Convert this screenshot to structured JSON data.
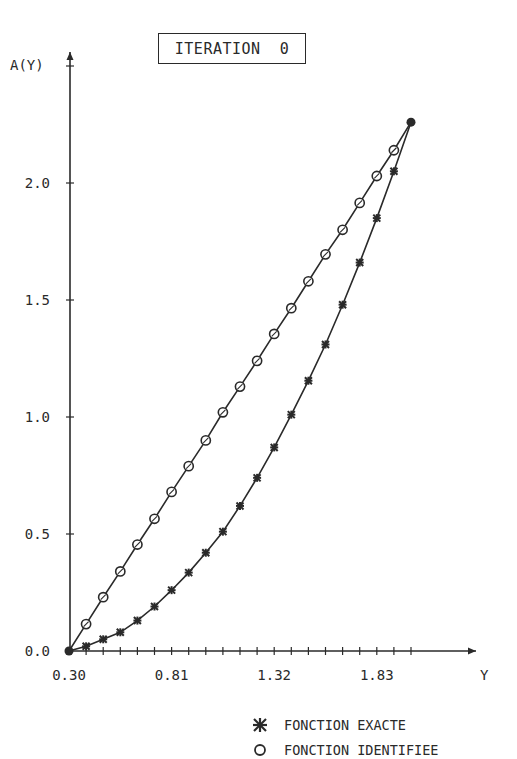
{
  "chart_data": {
    "type": "line",
    "title": "ITERATION  0",
    "xlabel": "Y",
    "ylabel": "A(Y)",
    "xlim": [
      0.3,
      2.29
    ],
    "ylim": [
      0.0,
      2.55
    ],
    "x_tick_labels": [
      "0.30",
      "0.81",
      "1.32",
      "1.83"
    ],
    "x_tick_label_values": [
      0.3,
      0.81,
      1.32,
      1.83
    ],
    "x_minor_tick_step": 0.085,
    "y_tick_labels": [
      "0.0",
      "0.5",
      "1.0",
      "1.5",
      "2.0"
    ],
    "y_tick_label_values": [
      0.0,
      0.5,
      1.0,
      1.5,
      2.0
    ],
    "grid": false,
    "legend_position": "bottom-right, below plot",
    "x": [
      0.3,
      0.385,
      0.47,
      0.555,
      0.64,
      0.725,
      0.81,
      0.895,
      0.98,
      1.065,
      1.15,
      1.235,
      1.32,
      1.405,
      1.49,
      1.575,
      1.66,
      1.745,
      1.83,
      1.915,
      2.0
    ],
    "series": [
      {
        "name": "FONCTION EXACTE",
        "marker": "star",
        "values": [
          0.0,
          0.02,
          0.05,
          0.08,
          0.13,
          0.19,
          0.26,
          0.335,
          0.42,
          0.51,
          0.62,
          0.74,
          0.87,
          1.01,
          1.155,
          1.31,
          1.48,
          1.66,
          1.85,
          2.05,
          2.26
        ]
      },
      {
        "name": "FONCTION IDENTIFIEE",
        "marker": "circle",
        "values": [
          0.0,
          0.115,
          0.23,
          0.34,
          0.455,
          0.565,
          0.68,
          0.79,
          0.9,
          1.02,
          1.13,
          1.24,
          1.355,
          1.465,
          1.58,
          1.695,
          1.8,
          1.915,
          2.03,
          2.14,
          2.26
        ]
      }
    ]
  },
  "title": "ITERATION  0",
  "axes": {
    "y_label": "A(Y)",
    "x_label": "Y",
    "x_ticks": [
      "0.30",
      "0.81",
      "1.32",
      "1.83"
    ],
    "y_ticks": [
      "0.0",
      "0.5",
      "1.0",
      "1.5",
      "2.0"
    ]
  },
  "legend": {
    "items": [
      {
        "label": "FONCTION EXACTE",
        "symbol": "star"
      },
      {
        "label": "FONCTION IDENTIFIEE",
        "symbol": "circle"
      }
    ]
  },
  "colors": {
    "ink": "#2a2a2a",
    "background": "#ffffff"
  }
}
